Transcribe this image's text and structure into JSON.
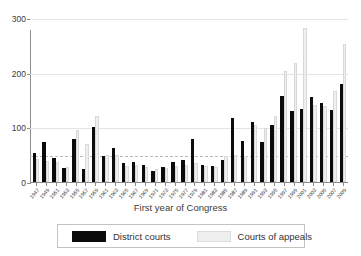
{
  "chart_data": {
    "type": "bar",
    "title": "",
    "xlabel": "First year of Congress",
    "ylabel": "",
    "ylim": [
      0,
      300
    ],
    "yticks": [
      0,
      100,
      200,
      300
    ],
    "grid": true,
    "legend_position": "bottom",
    "reference_line": 50,
    "categories": [
      "1947",
      "1949",
      "1951",
      "1953",
      "1955",
      "1957",
      "1959",
      "1961",
      "1963",
      "1965",
      "1967",
      "1969",
      "1971",
      "1973",
      "1975",
      "1977",
      "1979",
      "1981",
      "1983",
      "1985",
      "1987",
      "1989",
      "1991",
      "1993",
      "1995",
      "1997",
      "1999",
      "2001",
      "2003",
      "2005",
      "2007",
      "2009"
    ],
    "series": [
      {
        "name": "District courts",
        "color": "#0b0b0b",
        "values": [
          53,
          74,
          44,
          25,
          78,
          23,
          100,
          48,
          62,
          34,
          37,
          31,
          21,
          27,
          36,
          41,
          78,
          32,
          29,
          41,
          118,
          75,
          109,
          73,
          105,
          158,
          130,
          134,
          155,
          144,
          131,
          180
        ]
      },
      {
        "name": "Courts of appeals",
        "color": "#efefef",
        "values": [
          42,
          39,
          37,
          28,
          95,
          69,
          120,
          50,
          49,
          30,
          32,
          27,
          24,
          25,
          30,
          32,
          34,
          30,
          27,
          47,
          50,
          48,
          104,
          98,
          120,
          203,
          217,
          282,
          140,
          139,
          167,
          252
        ]
      }
    ]
  },
  "axis": {
    "y_tick_labels": [
      "300",
      "200",
      "100",
      "0"
    ],
    "x_title": "First year of Congress"
  },
  "legend": {
    "entries": [
      {
        "label": "District courts",
        "color": "#0b0b0b"
      },
      {
        "label": "Courts of appeals",
        "color": "#efefef"
      }
    ]
  }
}
